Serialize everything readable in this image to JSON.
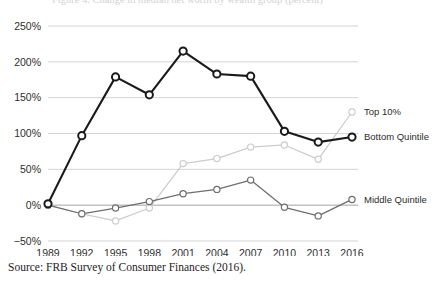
{
  "figure": {
    "clipped_title": "Figure 4.  Change in median net worth by wealth group (percent)",
    "source_note": "Source: FRB Survey of Consumer Finances (2016)."
  },
  "chart_data": {
    "type": "line",
    "title": "",
    "xlabel": "",
    "ylabel": "",
    "x": [
      1989,
      1992,
      1995,
      1998,
      2001,
      2004,
      2007,
      2010,
      2013,
      2016
    ],
    "categories": [
      "1989",
      "1992",
      "1995",
      "1998",
      "2001",
      "2004",
      "2007",
      "2010",
      "2013",
      "2016"
    ],
    "ylim": [
      -50,
      250
    ],
    "yticks": [
      -50,
      0,
      50,
      100,
      150,
      200,
      250
    ],
    "ytick_labels": [
      "−50%",
      "0%",
      "50%",
      "100%",
      "150%",
      "200%",
      "250%"
    ],
    "grid": true,
    "legend_position": "right-of-plot-inline",
    "series": [
      {
        "name": "Top 10%",
        "color": "#cccccc",
        "values": [
          0,
          -12,
          -22,
          -4,
          58,
          65,
          81,
          84,
          64,
          130
        ]
      },
      {
        "name": "Bottom Quintile",
        "color": "#1a1a1a",
        "values": [
          2,
          97,
          179,
          154,
          215,
          183,
          180,
          103,
          88,
          95
        ]
      },
      {
        "name": "Middle Quintile",
        "color": "#6e6e6e",
        "values": [
          0,
          -12,
          -4,
          5,
          16,
          22,
          35,
          -3,
          -15,
          8
        ]
      }
    ]
  }
}
